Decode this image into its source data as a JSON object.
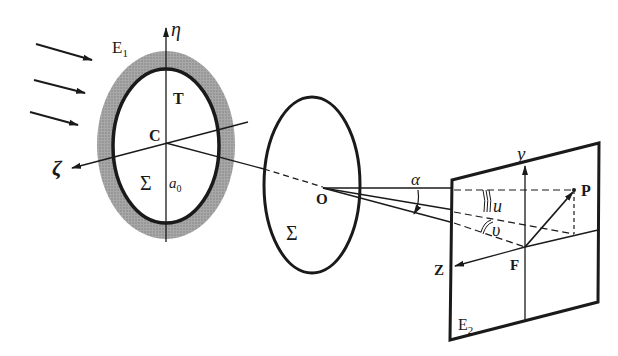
{
  "diagram": {
    "type": "optical diffraction geometry",
    "labels": {
      "plane1": "E",
      "plane1_sub": "1",
      "plane2": "E",
      "plane2_sub": "2",
      "eta_axis": "η",
      "zeta_axis": "ζ",
      "aperture_center": "C",
      "aperture_T": "T",
      "aperture_sigma": "Σ",
      "aperture_a": "a",
      "aperture_a_sub": "0",
      "lens_center": "O",
      "lens_sigma": "Σ",
      "angle_alpha": "α",
      "angle_u": "u",
      "angle_v": "υ",
      "screen_y_axis": "y",
      "screen_z_axis": "Z",
      "focal_point": "F",
      "point_P": "P"
    },
    "colors": {
      "ink": "#1a1a1a",
      "shaded_ring": "#9a9a9a",
      "background": "#ffffff"
    }
  }
}
